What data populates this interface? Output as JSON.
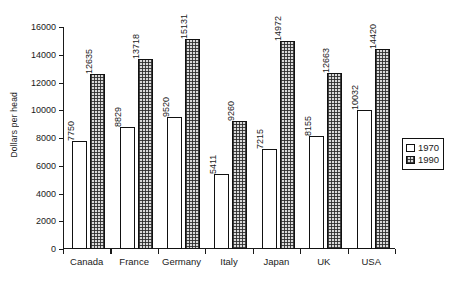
{
  "chart_data": {
    "type": "bar",
    "title": "",
    "xlabel": "",
    "ylabel": "Dollars per head",
    "ylim": [
      0,
      16000
    ],
    "ytick_labels": [
      "0",
      "2000",
      "4000",
      "6000",
      "8000",
      "10000",
      "12000",
      "14000",
      "16000"
    ],
    "ytick_values": [
      0,
      2000,
      4000,
      6000,
      8000,
      10000,
      12000,
      14000,
      16000
    ],
    "grid": false,
    "legend_position": "right",
    "categories": [
      "Canada",
      "France",
      "Germany",
      "Italy",
      "Japan",
      "UK",
      "USA"
    ],
    "series": [
      {
        "name": "1970",
        "values": [
          7750,
          8829,
          9520,
          5411,
          7215,
          8155,
          10032
        ],
        "labels": [
          "7750",
          "8829",
          "9520",
          "5411",
          "7215",
          "8155",
          "10032"
        ],
        "fill": "white",
        "color": "#ffffff"
      },
      {
        "name": "1990",
        "values": [
          12635,
          13718,
          15131,
          9260,
          14972,
          12663,
          14420
        ],
        "labels": [
          "12635",
          "13718",
          "15131",
          "9260",
          "14972",
          "12663",
          "14420"
        ],
        "fill": "checkered",
        "color": "#d9d9d9"
      }
    ],
    "legend_entries": [
      "1970",
      "1990"
    ],
    "axis_color": "#111111",
    "background": "#ffffff"
  }
}
